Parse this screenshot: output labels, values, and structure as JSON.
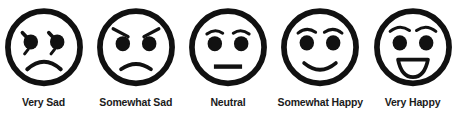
{
  "diagram": {
    "name": "five-point-smiley-face-satisfaction-scale",
    "background_color": "#ffffff",
    "stroke_color": "#111111",
    "label_color": "#1b1b1b",
    "items": [
      {
        "id": "very-sad",
        "label": "Very Sad",
        "icon": "frowning-face-with-tear-icon",
        "mouth": "deep-frown",
        "brow": "teardrop-lash"
      },
      {
        "id": "somewhat-sad",
        "label": "Somewhat Sad",
        "icon": "slightly-frowning-face-icon",
        "mouth": "shallow-frown",
        "brow": "slanted-worried-brows"
      },
      {
        "id": "neutral",
        "label": "Neutral",
        "icon": "neutral-face-icon",
        "mouth": "straight-line",
        "brow": "curved-brows"
      },
      {
        "id": "somewhat-happy",
        "label": "Somewhat Happy",
        "icon": "slightly-smiling-face-icon",
        "mouth": "closed-smile",
        "brow": "curved-brows"
      },
      {
        "id": "very-happy",
        "label": "Very Happy",
        "icon": "grinning-face-icon",
        "mouth": "open-smile",
        "brow": "curved-brows"
      }
    ]
  }
}
